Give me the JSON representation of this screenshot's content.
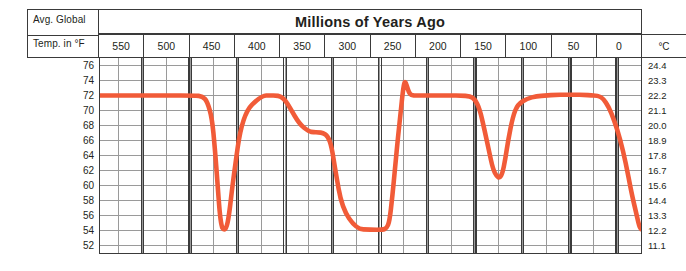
{
  "header": {
    "corner_line1": "Avg. Global",
    "corner_line2": "Temp. in °F",
    "title": "Millions of Years Ago",
    "right_axis_unit": "°C"
  },
  "colors": {
    "line": "#f15b38",
    "grid_major": "#3a3a3a",
    "grid_minor": "#9a9a9a",
    "text": "#231f20",
    "background": "#ffffff"
  },
  "chart_data": {
    "type": "line",
    "title": "Millions of Years Ago",
    "xlabel": "Millions of Years Ago",
    "ylabel": "Avg. Global Temp. in °F",
    "y2label": "°C",
    "grid": true,
    "legend": "none",
    "x_reversed": true,
    "xlim": [
      570,
      0
    ],
    "ylim": [
      51,
      77
    ],
    "x_ticks": [
      550,
      500,
      450,
      400,
      350,
      300,
      250,
      200,
      150,
      100,
      50,
      0
    ],
    "x_tick_labels": [
      "550",
      "500",
      "450",
      "400",
      "350",
      "300",
      "250",
      "200",
      "150",
      "100",
      "50",
      "0"
    ],
    "y_ticks": [
      76,
      74,
      72,
      70,
      68,
      66,
      64,
      62,
      60,
      58,
      56,
      54,
      52
    ],
    "y_tick_labels": [
      "76",
      "74",
      "72",
      "70",
      "68",
      "66",
      "64",
      "62",
      "60",
      "58",
      "56",
      "54",
      "52"
    ],
    "y2_tick_labels": [
      "24.4",
      "23.3",
      "22.2",
      "21.1",
      "20.0",
      "18.9",
      "17.8",
      "16.7",
      "15.6",
      "14.4",
      "13.3",
      "12.2",
      "11.1"
    ],
    "series": [
      {
        "name": "Average global temperature",
        "color": "#f15b38",
        "x": [
          570,
          540,
          500,
          470,
          462,
          457,
          452,
          449,
          446,
          444,
          442,
          440,
          437,
          434,
          430,
          420,
          400,
          390,
          385,
          380,
          375,
          370,
          360,
          350,
          345,
          340,
          335,
          330,
          326,
          322,
          315,
          300,
          285,
          272,
          268,
          265,
          262,
          259,
          256,
          253,
          251,
          249,
          247,
          244,
          240,
          230,
          220,
          210,
          200,
          190,
          180,
          175,
          170,
          165,
          160,
          156,
          152,
          149,
          146,
          143,
          140,
          135,
          130,
          120,
          110,
          100,
          90,
          80,
          70,
          60,
          52,
          48,
          44,
          40,
          34,
          28,
          22,
          16,
          10,
          5,
          2,
          0
        ],
        "y": [
          72.0,
          72.0,
          72.0,
          72.0,
          71.9,
          71.2,
          69.0,
          65.0,
          60.0,
          56.5,
          54.6,
          54.1,
          54.2,
          56.0,
          60.5,
          69.5,
          72.0,
          72.0,
          72.0,
          71.9,
          71.4,
          70.4,
          68.2,
          67.2,
          67.1,
          67.1,
          67.0,
          66.6,
          65.2,
          62.0,
          57.0,
          54.2,
          54.1,
          54.1,
          54.3,
          55.2,
          58.5,
          62.5,
          66.5,
          70.0,
          72.5,
          74.0,
          73.4,
          72.2,
          72.0,
          72.0,
          72.0,
          72.0,
          72.0,
          72.0,
          71.9,
          71.5,
          70.2,
          67.5,
          64.5,
          62.2,
          61.2,
          61.0,
          61.6,
          63.5,
          66.0,
          69.2,
          70.8,
          71.6,
          71.9,
          72.0,
          72.1,
          72.1,
          72.1,
          72.1,
          72.0,
          72.0,
          71.9,
          71.6,
          70.5,
          68.6,
          66.2,
          63.0,
          59.0,
          56.3,
          54.6,
          54.2
        ],
        "annotations": []
      }
    ]
  }
}
